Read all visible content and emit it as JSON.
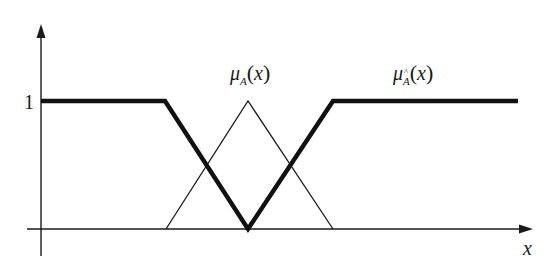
{
  "diagram": {
    "type": "fuzzy-membership-functions",
    "axes": {
      "x_label": "x",
      "y_tick_label": "1"
    },
    "labels": {
      "mu_a": {
        "mu": "μ",
        "sub": "A",
        "open": "(",
        "var": "x",
        "close": ")"
      },
      "mu_a_hat": {
        "mu": "μ",
        "sub": "Â",
        "sub_base": "A",
        "open": "(",
        "var": "x",
        "close": ")"
      }
    },
    "colors": {
      "line": "#1a1a1a",
      "background": "#ffffff"
    },
    "curves": [
      {
        "name": "mu_A(x)",
        "style": "thin",
        "shape": "triangle",
        "points": [
          [
            0.0,
            0
          ],
          [
            0.5,
            1
          ],
          [
            1.0,
            0
          ]
        ]
      },
      {
        "name": "mu_Â(x)",
        "style": "thick",
        "shape": "complement (inverted triangle with shoulders)",
        "points": [
          [
            -1.0,
            1
          ],
          [
            0.0,
            1
          ],
          [
            0.5,
            0
          ],
          [
            1.0,
            1
          ],
          [
            2.1,
            1
          ]
        ]
      }
    ]
  }
}
